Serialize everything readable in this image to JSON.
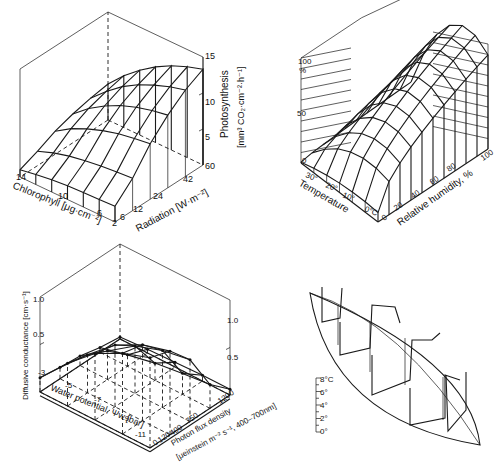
{
  "chart_data": [
    {
      "type": "surface3d",
      "panel": "top-left",
      "title": "",
      "zlabel_line1": "Photosynthesis",
      "zlabel_line2": "[mm³ CO₂·cm⁻²·h⁻¹]",
      "xlabel": "Chlorophyll [μg·cm⁻²]",
      "ylabel": "Radiation [W·m⁻²]",
      "x_ticks": [
        "14",
        "10",
        "6",
        "2"
      ],
      "y_ticks": [
        "6",
        "12",
        "24",
        "42",
        "60"
      ],
      "z_ticks": [
        "5",
        "10",
        "15"
      ],
      "zlim": [
        0,
        15
      ],
      "x": [
        2,
        4,
        6,
        8,
        10,
        12,
        14
      ],
      "y": [
        6,
        12,
        24,
        36,
        48,
        60
      ],
      "z": [
        [
          1.0,
          2.0,
          3.2,
          4.0,
          4.6,
          5.0
        ],
        [
          1.4,
          2.8,
          4.6,
          5.8,
          6.6,
          7.2
        ],
        [
          1.7,
          3.4,
          5.6,
          7.2,
          8.3,
          9.0
        ],
        [
          1.9,
          3.8,
          6.4,
          8.3,
          9.6,
          10.5
        ],
        [
          2.0,
          4.1,
          7.0,
          9.1,
          10.6,
          11.7
        ],
        [
          2.1,
          4.3,
          7.4,
          9.7,
          11.4,
          12.6
        ],
        [
          2.2,
          4.5,
          7.7,
          10.1,
          12.0,
          13.3
        ]
      ]
    },
    {
      "type": "surface3d",
      "panel": "top-right",
      "zlabel": "%",
      "xlabel": "Temperature",
      "ylabel": "Relative humidity, %",
      "x_ticks": [
        "30°",
        "20°",
        "10°",
        "0°C"
      ],
      "y_ticks": [
        "0",
        "20",
        "40",
        "60",
        "80",
        "100"
      ],
      "z_ticks": [
        "0",
        "50",
        "100"
      ],
      "zlim": [
        0,
        100
      ],
      "x": [
        0,
        5,
        10,
        15,
        20,
        25,
        30
      ],
      "y": [
        0,
        10,
        20,
        30,
        40,
        50,
        60,
        70,
        80,
        90,
        100
      ],
      "z_description": "Relative value rises with humidity toward 100% and peaks at intermediate-to-low temperatures; near 0% at 30° and dry conditions"
    },
    {
      "type": "surface3d",
      "panel": "bottom-left",
      "zlabel": "Diffusive conductance [cm·s⁻¹]",
      "xlabel": "Water potential, Ψw [bar]",
      "ylabel_line1": "Photon flux density",
      "ylabel_line2": "[μeinstein m⁻² s⁻¹, 400–700nm]",
      "x_ticks": [
        "-3",
        "-5",
        "-7",
        "-9",
        "-11"
      ],
      "y_ticks": [
        "0",
        "120",
        "400",
        "750",
        "1200"
      ],
      "z_ticks_left": [
        "0.5",
        "1.0"
      ],
      "z_ticks_right": [
        "0.5",
        "1.0"
      ],
      "zlim": [
        0,
        1.0
      ],
      "x": [
        -3,
        -5,
        -7,
        -9,
        -11
      ],
      "y": [
        0,
        120,
        400,
        750,
        1200
      ],
      "z": [
        [
          0.15,
          0.45,
          0.7,
          0.85,
          0.95
        ],
        [
          0.12,
          0.4,
          0.65,
          0.8,
          0.88
        ],
        [
          0.1,
          0.3,
          0.5,
          0.6,
          0.65
        ],
        [
          0.05,
          0.12,
          0.18,
          0.22,
          0.25
        ],
        [
          0.02,
          0.04,
          0.05,
          0.06,
          0.06
        ]
      ]
    },
    {
      "type": "profile3d",
      "panel": "bottom-right",
      "scale_label": "8°C",
      "scale_ticks": [
        "0°",
        "2°",
        "4°",
        "6°",
        "8°C"
      ],
      "description": "Leaf-shaped outline with vertical temperature profile sections (0–8°C)"
    }
  ]
}
